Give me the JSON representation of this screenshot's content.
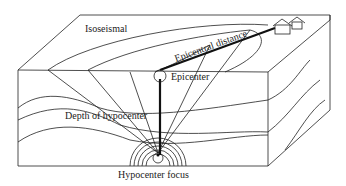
{
  "diagram": {
    "labels": {
      "isoseismal": "Isoseismal",
      "epicentral_distance": "Epicentral distance",
      "epicenter": "Epicenter",
      "depth_of_hypocenter": "Depth of hypocenter",
      "hypocenter_focus": "Hypocenter focus"
    },
    "colors": {
      "line": "#222222",
      "background": "#ffffff"
    }
  }
}
